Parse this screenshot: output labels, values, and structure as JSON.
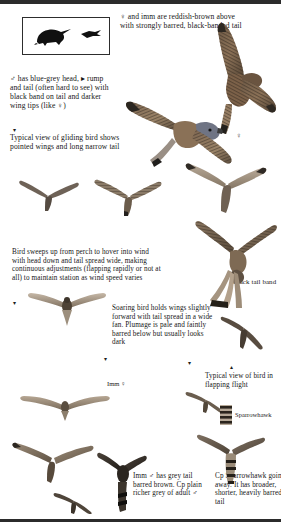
{
  "plate": {
    "title": "Kestrel flight identification plate",
    "subject": "Kestrel"
  },
  "silhouette_box": {
    "name": "perched and flying silhouette box",
    "shapes": [
      "perched-bird-silhouette",
      "flying-bird-silhouette"
    ]
  },
  "captions": {
    "female_immature": "♀ and imm are reddish-brown above with strongly barred, black-banded tail",
    "male": "♂ has blue-grey head, ▸ rump and tail (often hard to see) with black band on tail and darker wing tips (like ♀)",
    "gliding": "Typical view of gliding bird shows pointed wings and long narrow tail",
    "hovering": "Bird sweeps up from perch to hover into wind with head down and tail spread wide, making continuous adjustments (flapping rapidly or not at all) to maintain station as wind speed varies",
    "soaring": "Soaring bird holds wings slightly forward with tail spread in a wide fan. Plumage is pale and faintly barred below but usually looks dark",
    "black_tail_band": "Black tail band",
    "flapping": "Typical view of bird in flapping flight",
    "immature_male": "Imm ♂ has grey tail barred brown. Cp plain richer grey of adult ♂",
    "sparrowhawk_compare": "Cp Sparrowhawk going away. It has broader, shorter, heavily barred tail"
  },
  "labels": {
    "imm_female": "Imm ♀",
    "sparrowhawk": "Sparrowhawk",
    "female_symbol": "♀"
  },
  "symbols": {
    "male": "♂",
    "female": "♀",
    "pointer_right": "▸",
    "pointer_down": "▾",
    "pointer_up": "▴"
  },
  "colors": {
    "ink": "#1a1a1a",
    "rule": "#2b2b2b",
    "plumage_warm": "#8a6a4e",
    "plumage_dark": "#3a3128",
    "plumage_pale": "#cdbfae",
    "background": "#ffffff"
  },
  "figures": [
    {
      "name": "female-kestrel-upperside-gliding",
      "position": "top-right"
    },
    {
      "name": "male-kestrel-upperside-gliding",
      "position": "top-centre"
    },
    {
      "name": "kestrel-gliding-silhouette-left",
      "position": "mid-left"
    },
    {
      "name": "kestrel-gliding-silhouette-centre",
      "position": "mid-centre"
    },
    {
      "name": "kestrel-gliding-underside-right",
      "position": "mid-right"
    },
    {
      "name": "kestrel-hovering",
      "position": "centre-right"
    },
    {
      "name": "kestrel-soaring-underside",
      "position": "centre-left"
    },
    {
      "name": "kestrel-flying-away-small",
      "position": "centre-right-lower"
    },
    {
      "name": "immature-female-kestrel-underside",
      "position": "lower-left"
    },
    {
      "name": "kestrel-flapping-small",
      "position": "lower-right"
    },
    {
      "name": "sparrowhawk-tail-detail",
      "position": "lower-right"
    },
    {
      "name": "kestrel-underside-bottom-left",
      "position": "bottom-left"
    },
    {
      "name": "immature-male-kestrel-bottom",
      "position": "bottom-centre"
    },
    {
      "name": "kestrel-silhouette-bottom",
      "position": "bottom-centre-low"
    },
    {
      "name": "sparrowhawk-going-away-bottom",
      "position": "bottom-right"
    }
  ]
}
